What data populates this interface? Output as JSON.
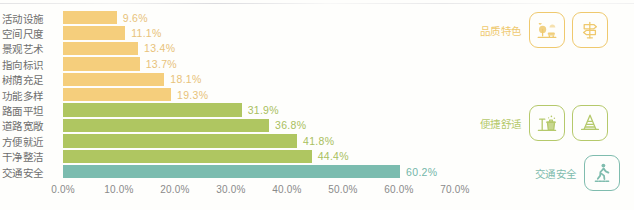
{
  "chart_data": {
    "type": "bar",
    "orientation": "horizontal",
    "title": "",
    "xlabel": "",
    "ylabel": "",
    "xlim": [
      0,
      70
    ],
    "grid": false,
    "categories": [
      "活动设施",
      "空间尺度",
      "景观艺术",
      "指向标识",
      "树荫充足",
      "功能多样",
      "路面平坦",
      "道路宽敞",
      "方便就近",
      "干净整洁",
      "交通安全"
    ],
    "values": [
      9.6,
      11.1,
      13.4,
      13.7,
      18.1,
      19.3,
      31.9,
      36.8,
      41.8,
      44.4,
      60.2
    ],
    "value_labels": [
      "9.6%",
      "11.1%",
      "13.4%",
      "13.7%",
      "18.1%",
      "19.3%",
      "31.9%",
      "36.8%",
      "41.8%",
      "44.4%",
      "60.2%"
    ],
    "bar_colors": [
      "#F5CE7C",
      "#F5CE7C",
      "#F5CE7C",
      "#F5CE7C",
      "#F5CE7C",
      "#F5CE7C",
      "#AFC661",
      "#AFC661",
      "#AFC661",
      "#AFC661",
      "#7BBCAF"
    ],
    "label_colors": [
      "#E8C27A",
      "#E8C27A",
      "#E8C27A",
      "#E8C27A",
      "#E8C27A",
      "#E8C27A",
      "#A9C05E",
      "#A9C05E",
      "#A9C05E",
      "#A9C05E",
      "#74B6A9"
    ],
    "xticks": [
      0,
      10,
      20,
      30,
      40,
      50,
      60,
      70
    ],
    "xtick_labels": [
      "0.0%",
      "10.0%",
      "20.0%",
      "30.0%",
      "40.0%",
      "50.0%",
      "60.0%",
      "70.0%"
    ]
  },
  "annotations": {
    "groups": [
      {
        "label": "品质特色",
        "color": "#EFC96E",
        "icons": [
          "park-landscape-icon",
          "signpost-icon"
        ]
      },
      {
        "label": "便捷舒适",
        "color": "#B5C96B",
        "icons": [
          "trash-bin-cleaning-icon",
          "traffic-cone-icon"
        ]
      },
      {
        "label": "交通安全",
        "color": "#7FBCAE",
        "icons": [
          "pedestrian-crosswalk-icon"
        ]
      }
    ]
  },
  "palette": {
    "quality_yellow": "#F5CE7C",
    "comfort_green": "#AFC661",
    "safety_teal": "#7BBCAF",
    "background": "#FEFEFC",
    "category_text": "#6E6E6E",
    "axis_text": "#8A8A8A"
  }
}
